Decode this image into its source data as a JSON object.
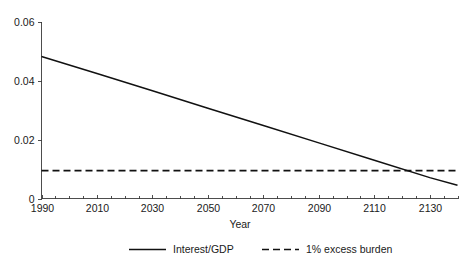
{
  "chart_data": {
    "type": "line",
    "title": "",
    "subtitle": "",
    "xlabel": "Year",
    "ylabel": "",
    "xlim": [
      1990,
      2140
    ],
    "ylim": [
      0,
      0.06
    ],
    "grid": false,
    "legend_position": "bottom",
    "x_ticks": [
      1990,
      2010,
      2030,
      2050,
      2070,
      2090,
      2110,
      2130
    ],
    "x_tick_labels": [
      "1990",
      "2010",
      "2030",
      "2050",
      "2070",
      "2090",
      "2110",
      "2130"
    ],
    "x_minor_tick_step": 5,
    "y_ticks": [
      0,
      0.02,
      0.04,
      0.06
    ],
    "y_tick_labels": [
      "0",
      "0.02",
      "0.04",
      "0.06"
    ],
    "series": [
      {
        "name": "Interest/GDP",
        "style": "solid",
        "color": "#111111",
        "x": [
          1990,
          2010,
          2030,
          2050,
          2070,
          2090,
          2110,
          2130,
          2140
        ],
        "values": [
          0.0483,
          0.0425,
          0.0366,
          0.0307,
          0.0248,
          0.0189,
          0.013,
          0.0071,
          0.0045
        ]
      },
      {
        "name": "1% excess burden",
        "style": "dashed",
        "color": "#111111",
        "x": [
          1990,
          2140
        ],
        "values": [
          0.0095,
          0.0095
        ]
      }
    ],
    "annotations": [
      {
        "label": "crossing-point",
        "x": 2120,
        "y": 0.0095
      }
    ]
  },
  "legend": {
    "items": [
      {
        "label": "Interest/GDP",
        "style": "solid"
      },
      {
        "label": "1% excess burden",
        "style": "dashed"
      }
    ]
  }
}
